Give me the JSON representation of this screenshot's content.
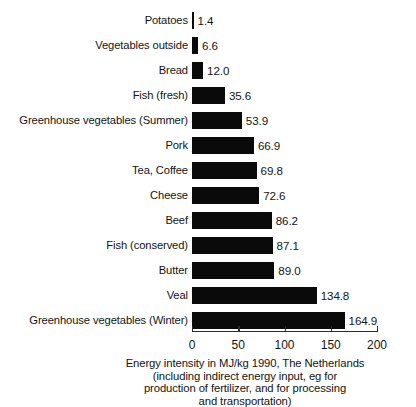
{
  "chart_data": {
    "type": "bar",
    "orientation": "horizontal",
    "title": "",
    "xlabel": "Energy intensity in MJ/kg 1990, The Netherlands (including indirect energy input, eg for production of fertilizer, and for processing and transportation)",
    "ylabel": "",
    "xlim": [
      0,
      200
    ],
    "grid": false,
    "legend": null,
    "categories": [
      "Potatoes",
      "Vegetables outside",
      "Bread",
      "Fish (fresh)",
      "Greenhouse vegetables (Summer)",
      "Pork",
      "Tea, Coffee",
      "Cheese",
      "Beef",
      "Fish (conserved)",
      "Butter",
      "Veal",
      "Greenhouse vegetables (Winter)"
    ],
    "values": [
      1.4,
      6.6,
      12.0,
      35.6,
      53.9,
      66.9,
      69.8,
      72.6,
      86.2,
      87.1,
      89.0,
      134.8,
      164.9
    ],
    "value_labels": [
      "1.4",
      "6.6",
      "12.0",
      "35.6",
      "53.9",
      "66.9",
      "69.8",
      "72.6",
      "86.2",
      "87.1",
      "89.0",
      "134.8",
      "164.9"
    ],
    "xticks": [
      0,
      50,
      100,
      150,
      200
    ],
    "xtick_labels": [
      "0",
      "50",
      "100",
      "150",
      "200"
    ],
    "bar_color": "#0a0a0a",
    "background_color": "#ffffff",
    "axis_color": "#2b2b2b"
  },
  "caption": {
    "line1": "Energy intensity in MJ/kg 1990, The Netherlands",
    "line2": "(including indirect energy input, eg for",
    "line3": "production of fertilizer, and for processing",
    "line4": "and transportation)"
  }
}
